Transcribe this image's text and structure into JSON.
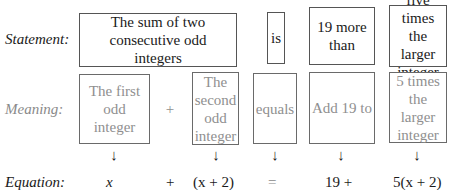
{
  "rows": {
    "statement_label": "Statement:",
    "meaning_label": "Meaning:",
    "equation_label": "Equation:"
  },
  "statement": [
    {
      "text": "The sum of two consecutive odd integers"
    },
    {
      "text": "is"
    },
    {
      "text": "19 more than"
    },
    {
      "text": "five times the larger integer"
    }
  ],
  "meaning": [
    {
      "text": "The first odd integer"
    },
    {
      "text": "+"
    },
    {
      "text": "The second odd integer"
    },
    {
      "text": "equals"
    },
    {
      "text": "Add 19 to"
    },
    {
      "text": "5 times the larger integer"
    }
  ],
  "arrows": [
    "↓",
    "↓",
    "↓",
    "↓",
    "↓"
  ],
  "equation": [
    {
      "text": "x"
    },
    {
      "text": "+"
    },
    {
      "text": "(x + 2)"
    },
    {
      "text": "="
    },
    {
      "text": "19 +"
    },
    {
      "text": "5(x + 2)"
    }
  ],
  "colors": {
    "statement_text": "#1a1a1a",
    "meaning_text": "#8f8f8f",
    "border": "#555555"
  }
}
